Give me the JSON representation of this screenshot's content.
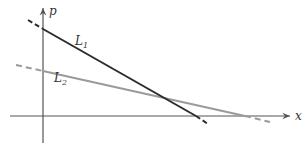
{
  "diagram": {
    "type": "linear-functions-graph",
    "axes": {
      "x_label": "x",
      "y_label": "p",
      "origin": [
        43,
        116
      ],
      "x_axis": {
        "from": [
          10,
          116
        ],
        "to": [
          291,
          116
        ]
      },
      "y_axis": {
        "from": [
          43,
          143
        ],
        "to": [
          43,
          7
        ]
      }
    },
    "lines": [
      {
        "id": "L1",
        "label_main": "L",
        "label_sub": "1",
        "color": "#2b2b2b",
        "dashed_start": [
          28,
          20
        ],
        "solid_start": [
          43,
          29
        ],
        "solid_end": [
          196,
          116
        ],
        "dashed_end": [
          208,
          124
        ],
        "label_pos": [
          75,
          45
        ]
      },
      {
        "id": "L2",
        "label_main": "L",
        "label_sub": "2",
        "color": "#9a9a9a",
        "dashed_start": [
          16,
          65
        ],
        "solid_start": [
          43,
          71
        ],
        "solid_end": [
          245,
          116
        ],
        "dashed_end": [
          270,
          122
        ],
        "label_pos": [
          54,
          82
        ]
      }
    ],
    "colors": {
      "axis": "#555555",
      "L1": "#2b2b2b",
      "L2": "#9a9a9a"
    }
  }
}
